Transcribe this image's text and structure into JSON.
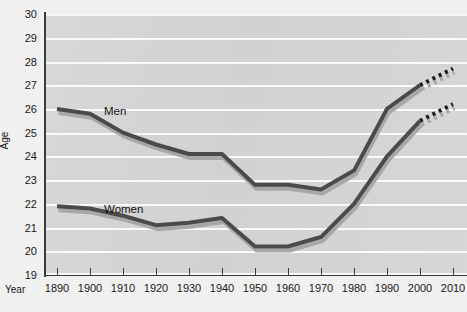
{
  "chart_data": {
    "type": "line",
    "title": "",
    "xlabel": "Year",
    "ylabel": "Age",
    "ylim": [
      19,
      30
    ],
    "xlim": [
      1890,
      2010
    ],
    "grid": true,
    "legend_position": "inline-labels",
    "y_ticks": [
      30,
      29,
      28,
      27,
      26,
      25,
      24,
      23,
      22,
      21,
      20,
      19
    ],
    "x_ticks": [
      1890,
      1900,
      1910,
      1920,
      1930,
      1940,
      1950,
      1960,
      1970,
      1980,
      1990,
      2000,
      2010
    ],
    "categories": [
      1890,
      1900,
      1910,
      1920,
      1930,
      1940,
      1950,
      1960,
      1970,
      1980,
      1990,
      2000
    ],
    "series": [
      {
        "name": "Men",
        "color": "#4a4a4a",
        "values": [
          26.0,
          25.8,
          25.0,
          24.5,
          24.1,
          24.1,
          22.8,
          22.8,
          22.6,
          23.4,
          26.0,
          27.0
        ],
        "projection": {
          "style": "dotted",
          "x": [
            2000,
            2010
          ],
          "values": [
            27.0,
            27.7
          ]
        }
      },
      {
        "name": "Women",
        "color": "#4a4a4a",
        "values": [
          21.9,
          21.8,
          21.5,
          21.1,
          21.2,
          21.4,
          20.2,
          20.2,
          20.6,
          22.0,
          24.0,
          25.5
        ],
        "projection": {
          "style": "dotted",
          "x": [
            2000,
            2010
          ],
          "values": [
            25.5,
            26.2
          ]
        }
      }
    ],
    "annotations": [
      {
        "text": "Men",
        "x": 1908,
        "y": 25.55
      },
      {
        "text": "Women",
        "x": 1910,
        "y": 22.25
      }
    ]
  },
  "axis": {
    "y_title": "Age",
    "x_title": "Year"
  },
  "colors": {
    "plot_background": "#d6d6d6",
    "page_background": "#f2f2f2",
    "gridline": "#fbfbfb",
    "line": "#4a4a4a",
    "shadow": "#a8a8a8",
    "axis": "#3a3a3a"
  }
}
